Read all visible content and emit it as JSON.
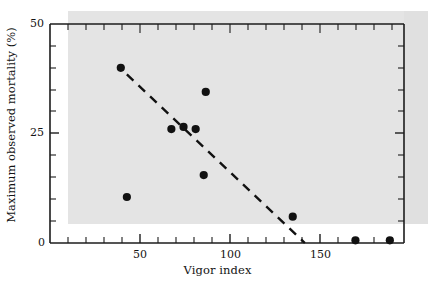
{
  "chart_data": {
    "type": "scatter",
    "title": "",
    "xlabel": "Vigor index",
    "ylabel": "Maximum observed mortality (%)",
    "xlim": [
      0,
      175
    ],
    "ylim": [
      0,
      50
    ],
    "xticks": [
      0,
      50,
      100,
      150
    ],
    "xtick_labels": [
      "0",
      "50",
      "100",
      "150"
    ],
    "xminor_step": 10,
    "yticks": [
      0,
      25,
      50
    ],
    "ytick_labels": [
      "0",
      "25",
      "50"
    ],
    "yminor_step": 5,
    "grid": false,
    "legend": null,
    "marker": "filled-circle",
    "marker_color": "#111111",
    "points": [
      {
        "x": 35,
        "y": 40
      },
      {
        "x": 38,
        "y": 10.5
      },
      {
        "x": 60,
        "y": 26
      },
      {
        "x": 66,
        "y": 26.5
      },
      {
        "x": 72,
        "y": 26
      },
      {
        "x": 77,
        "y": 34.5
      },
      {
        "x": 76,
        "y": 15.5
      },
      {
        "x": 120,
        "y": 6
      },
      {
        "x": 151,
        "y": 0.6
      },
      {
        "x": 168,
        "y": 0.6
      }
    ],
    "trendline": {
      "style": "dashed",
      "color": "#111111",
      "x_start": 38,
      "y_start": 38.5,
      "x_end": 126,
      "y_end": 0
    },
    "axis_spines": [
      "left",
      "bottom",
      "top",
      "right"
    ],
    "background_band_color": "#e4e4e4"
  },
  "axes": {
    "xlabel": "Vigor index",
    "ylabel": "Maximum observed mortality (%)",
    "x_tick_0": "0",
    "x_tick_50": "50",
    "x_tick_100": "100",
    "x_tick_150": "150",
    "y_tick_0": "0",
    "y_tick_25": "25",
    "y_tick_50": "50"
  }
}
